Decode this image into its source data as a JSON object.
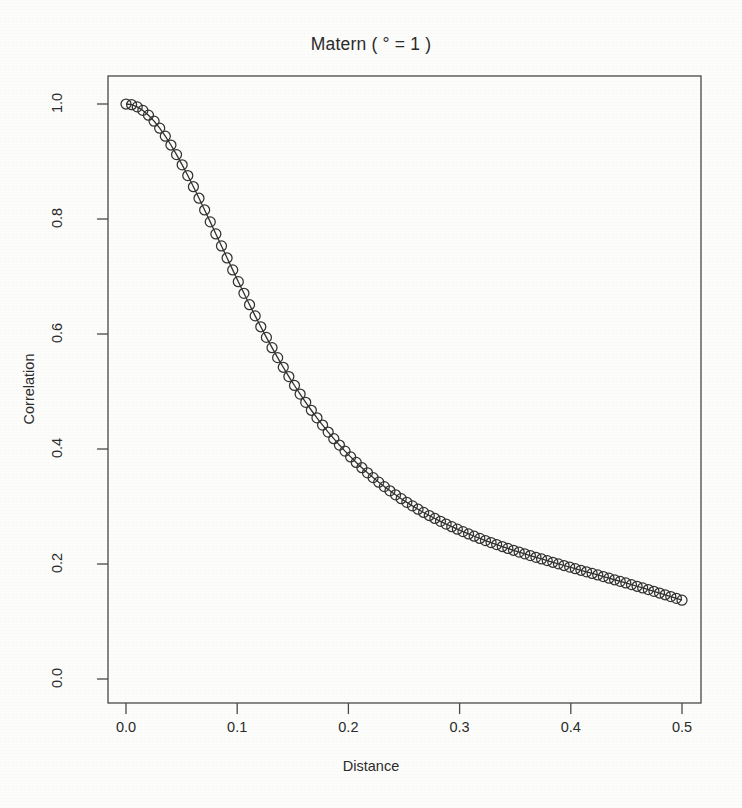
{
  "figure": {
    "background_color": "#fdfdfb",
    "foreground_color": "#2b2b2b"
  },
  "chart_data": {
    "type": "line",
    "title": "Matern ( ° = 1 )",
    "xlabel": "Distance",
    "ylabel": "Correlation",
    "xlim": [
      0.0,
      0.5
    ],
    "ylim": [
      0.0,
      1.0
    ],
    "grid": false,
    "legend": null,
    "marker": "open-circle",
    "line_style": "solid",
    "line_color": "#333333",
    "marker_color": "#333333",
    "xticks": [
      "0.0",
      "0.1",
      "0.2",
      "0.3",
      "0.4",
      "0.5"
    ],
    "xtick_values": [
      0.0,
      0.1,
      0.2,
      0.3,
      0.4,
      0.5
    ],
    "yticks": [
      "0.0",
      "0.2",
      "0.4",
      "0.6",
      "0.8",
      "1.0"
    ],
    "ytick_values": [
      0.0,
      0.2,
      0.4,
      0.6,
      0.8,
      1.0
    ],
    "x": [
      0.0,
      0.00505,
      0.0101,
      0.01515,
      0.0202,
      0.02525,
      0.0303,
      0.03535,
      0.0404,
      0.04545,
      0.0505,
      0.05556,
      0.06061,
      0.06566,
      0.07071,
      0.07576,
      0.08081,
      0.08586,
      0.09091,
      0.09596,
      0.10101,
      0.10606,
      0.11111,
      0.11616,
      0.12121,
      0.12626,
      0.13131,
      0.13636,
      0.14141,
      0.14646,
      0.15152,
      0.15657,
      0.16162,
      0.16667,
      0.17172,
      0.17677,
      0.18182,
      0.18687,
      0.19192,
      0.19697,
      0.20202,
      0.20707,
      0.21212,
      0.21717,
      0.22222,
      0.22727,
      0.23232,
      0.23737,
      0.24242,
      0.24747,
      0.25253,
      0.25758,
      0.26263,
      0.26768,
      0.27273,
      0.27778,
      0.28283,
      0.28788,
      0.29293,
      0.29798,
      0.30303,
      0.30808,
      0.31313,
      0.31818,
      0.32323,
      0.32828,
      0.33333,
      0.33838,
      0.34343,
      0.34848,
      0.35354,
      0.35859,
      0.36364,
      0.36869,
      0.37374,
      0.37879,
      0.38384,
      0.38889,
      0.39394,
      0.39899,
      0.40404,
      0.40909,
      0.41414,
      0.41919,
      0.42424,
      0.42929,
      0.43434,
      0.43939,
      0.44444,
      0.44949,
      0.45455,
      0.4596,
      0.46465,
      0.4697,
      0.47475,
      0.4798,
      0.48485,
      0.4899,
      0.49495,
      0.5
    ],
    "y": [
      1.0,
      0.99874,
      0.99499,
      0.98888,
      0.98055,
      0.97018,
      0.95795,
      0.94404,
      0.92866,
      0.91199,
      0.89423,
      0.87555,
      0.85613,
      0.83613,
      0.8157,
      0.79497,
      0.77407,
      0.75312,
      0.73222,
      0.71147,
      0.69095,
      0.67074,
      0.6509,
      0.63149,
      0.61255,
      0.59412,
      0.57623,
      0.55891,
      0.54217,
      0.52602,
      0.51047,
      0.49552,
      0.48116,
      0.46739,
      0.45419,
      0.44156,
      0.42947,
      0.41791,
      0.40686,
      0.39631,
      0.38623,
      0.3766,
      0.36741,
      0.35863,
      0.35025,
      0.34224,
      0.33459,
      0.32728,
      0.3203,
      0.31362,
      0.30723,
      0.30112,
      0.29527,
      0.28967,
      0.2843,
      0.27916,
      0.27422,
      0.26947,
      0.26492,
      0.26053,
      0.2563,
      0.25223,
      0.24829,
      0.24449,
      0.2408,
      0.23723,
      0.23376,
      0.23038,
      0.22709,
      0.22388,
      0.22074,
      0.21766,
      0.21464,
      0.21167,
      0.20875,
      0.20587,
      0.20302,
      0.2002,
      0.1974,
      0.19462,
      0.19186,
      0.18911,
      0.18637,
      0.18362,
      0.18088,
      0.17813,
      0.17537,
      0.1726,
      0.16981,
      0.167,
      0.16416,
      0.1613,
      0.15841,
      0.15549,
      0.15253,
      0.14953,
      0.14649,
      0.14341,
      0.14029,
      0.13712,
      0.0
    ],
    "n_points": 100,
    "annotations": []
  }
}
